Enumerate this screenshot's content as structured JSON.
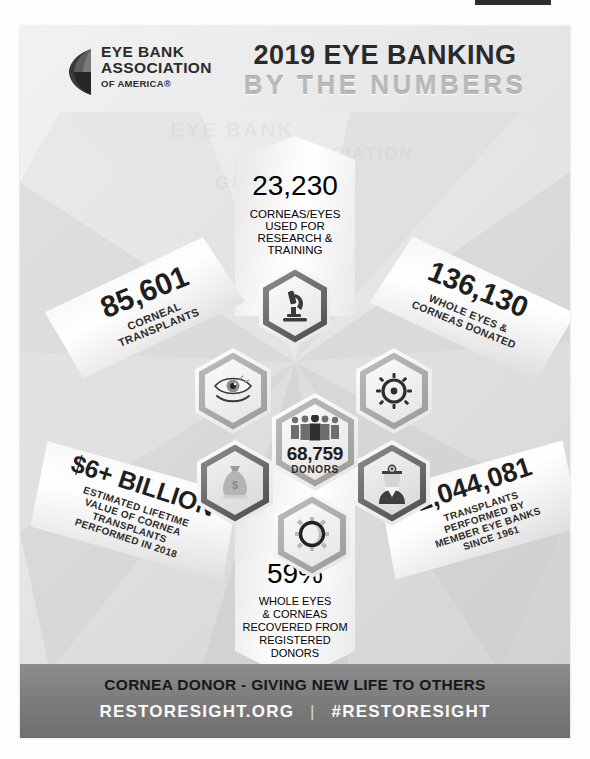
{
  "poster": {
    "organization": {
      "logo_line1": "EYE BANK",
      "logo_line2": "ASSOCIATION",
      "logo_line3": "OF AMERICA®",
      "logo_icon": "eye-globe-icon"
    },
    "title": {
      "line1": "2019 EYE BANKING",
      "line2": "BY THE NUMBERS"
    },
    "center": {
      "value": "68,759",
      "label": "DONORS",
      "icon": "people-group-icon"
    },
    "stats": [
      {
        "id": "research-training",
        "value": "23,230",
        "label": "CORNEAS/EYES\nUSED FOR\nRESEARCH &\nTRAINING",
        "label_lines": [
          "CORNEAS/EYES",
          "USED FOR",
          "RESEARCH &",
          "TRAINING"
        ],
        "icon": "microscope-icon",
        "position": "top"
      },
      {
        "id": "corneal-transplants",
        "value": "85,601",
        "label_lines": [
          "CORNEAL",
          "TRANSPLANTS"
        ],
        "icon": "eye-icon",
        "position": "upper-left"
      },
      {
        "id": "eyes-corneas-donated",
        "value": "136,130",
        "label_lines": [
          "WHOLE EYES &",
          "CORNEAS DONATED"
        ],
        "icon": "cornea-rays-icon",
        "position": "upper-right"
      },
      {
        "id": "lifetime-value",
        "value": "$6+ BILLION",
        "label_lines": [
          "ESTIMATED LIFETIME",
          "VALUE OF CORNEA",
          "TRANSPLANTS",
          "PERFORMED IN 2018"
        ],
        "icon": "money-bag-icon",
        "position": "lower-left"
      },
      {
        "id": "transplants-since-1961",
        "value": "2,044,081",
        "label_lines": [
          "TRANSPLANTS",
          "PERFORMED BY",
          "MEMBER EYE BANKS",
          "SINCE 1961"
        ],
        "icon": "surgeon-icon",
        "position": "lower-right"
      },
      {
        "id": "registered-donors-pct",
        "value": "59%",
        "label_lines": [
          "WHOLE EYES",
          "& CORNEAS",
          "RECOVERED FROM",
          "REGISTERED",
          "DONORS"
        ],
        "icon": "cornea-ring-icon",
        "position": "bottom"
      }
    ],
    "footer": {
      "tagline": "CORNEA DONOR - GIVING NEW LIFE TO OTHERS",
      "website": "RESTORESIGHT.ORG",
      "separator": "|",
      "hashtag": "#RESTORESIGHT"
    },
    "colors": {
      "ink": "#1f1f1f",
      "title_ghost": "#b9b9b9",
      "footer_bg": "#7d7d7d",
      "footer_text": "#fafafa"
    }
  }
}
